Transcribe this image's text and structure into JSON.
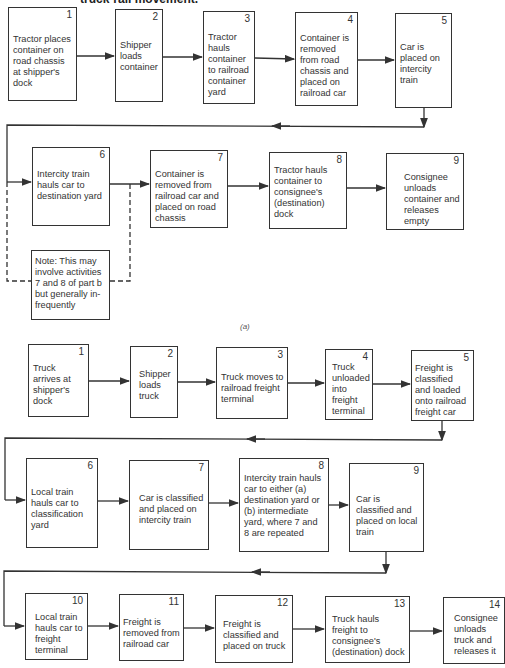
{
  "title": "truck-rail movement.",
  "part_a": {
    "caption": "(a)",
    "steps": [
      {
        "num": "1",
        "text": "Tractor places container on road chassis at shipper's dock"
      },
      {
        "num": "2",
        "text": "Shipper loads container"
      },
      {
        "num": "3",
        "text": "Tractor hauls container to railroad container yard"
      },
      {
        "num": "4",
        "text": "Container is removed from road chassis and placed on railroad car"
      },
      {
        "num": "5",
        "text": "Car is placed on intercity train"
      },
      {
        "num": "6",
        "text": "Intercity train hauls car to destination yard"
      },
      {
        "num": "7",
        "text": "Container is removed from railroad car and placed on road chassis"
      },
      {
        "num": "8",
        "text": "Tractor hauls container to consignee's (destination) dock"
      },
      {
        "num": "9",
        "text": "Consignee unloads container and releases empty"
      }
    ],
    "note": "Note: This may involve activities 7 and 8 of part b but generally in-frequently"
  },
  "part_b": {
    "steps": [
      {
        "num": "1",
        "text": "Truck arrives at shipper's dock"
      },
      {
        "num": "2",
        "text": "Shipper loads truck"
      },
      {
        "num": "3",
        "text": "Truck moves to railroad freight terminal"
      },
      {
        "num": "4",
        "text": "Truck unloaded into freight terminal"
      },
      {
        "num": "5",
        "text": "Freight is classified and loaded onto railroad freight car"
      },
      {
        "num": "6",
        "text": "Local train hauls car to classification yard"
      },
      {
        "num": "7",
        "text": "Car is classified and placed on intercity train"
      },
      {
        "num": "8",
        "text": "Intercity train hauls car to either (a) destination yard or (b) intermediate yard, where 7 and 8 are repeated"
      },
      {
        "num": "9",
        "text": "Car is classified and placed on local train"
      },
      {
        "num": "10",
        "text": "Local train hauls car to freight terminal"
      },
      {
        "num": "11",
        "text": "Freight is removed from railroad car"
      },
      {
        "num": "12",
        "text": "Freight is classified and placed on truck"
      },
      {
        "num": "13",
        "text": "Truck hauls freight to consignee's (destination) dock"
      },
      {
        "num": "14",
        "text": "Consignee unloads truck and releases it"
      }
    ]
  }
}
